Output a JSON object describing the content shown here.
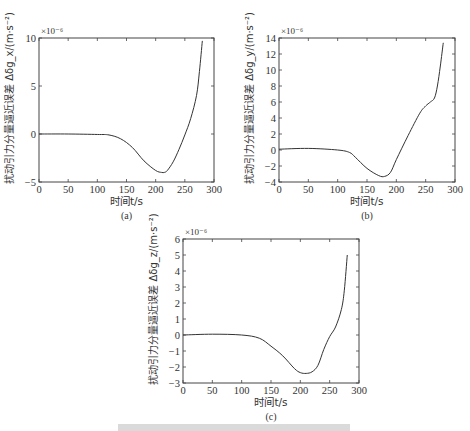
{
  "figure": {
    "caption_partial": "图 ... 摄动引力分量逼近误差 (caption cut off at bottom)"
  },
  "chart_data": [
    {
      "id": "a",
      "type": "line",
      "panel_label": "(a)",
      "xlabel": "时间t/s",
      "ylabel": "扰动引力分量逼近误差 Δδg_x/(m·s⁻²)",
      "y_multiplier": "×10⁻⁶",
      "xlim": [
        0,
        300
      ],
      "ylim": [
        -5,
        10
      ],
      "xticks": [
        0,
        50,
        100,
        150,
        200,
        250,
        300
      ],
      "yticks": [
        -5,
        0,
        5,
        10
      ],
      "grid": false,
      "x": [
        0,
        50,
        100,
        120,
        140,
        160,
        180,
        200,
        210,
        215,
        220,
        230,
        240,
        250,
        260,
        270,
        275,
        280
      ],
      "y": [
        0,
        0,
        -0.05,
        -0.1,
        -0.5,
        -1.4,
        -2.8,
        -3.8,
        -4.0,
        -4.0,
        -3.8,
        -2.9,
        -1.6,
        -0.1,
        1.6,
        4.0,
        6.5,
        9.7
      ]
    },
    {
      "id": "b",
      "type": "line",
      "panel_label": "(b)",
      "xlabel": "时间t/s",
      "ylabel": "扰动引力分量逼近误差 Δδg_y/(m·s⁻²)",
      "y_multiplier": "×10⁻⁶",
      "xlim": [
        0,
        300
      ],
      "ylim": [
        -4,
        14
      ],
      "xticks": [
        0,
        50,
        100,
        150,
        200,
        250,
        300
      ],
      "yticks": [
        -4,
        -2,
        0,
        2,
        4,
        6,
        8,
        10,
        12,
        14
      ],
      "grid": false,
      "x": [
        0,
        50,
        100,
        120,
        130,
        150,
        170,
        180,
        190,
        200,
        220,
        240,
        250,
        258,
        265,
        270,
        275,
        280
      ],
      "y": [
        0.1,
        0.2,
        0.0,
        -0.3,
        -0.9,
        -2.3,
        -3.2,
        -3.3,
        -2.8,
        -1.2,
        1.8,
        4.6,
        5.5,
        6.0,
        6.5,
        8.0,
        10.5,
        13.4
      ]
    },
    {
      "id": "c",
      "type": "line",
      "panel_label": "(c)",
      "xlabel": "时间t/s",
      "ylabel": "扰动引力分量逼近误差 Δδg_z/(m·s⁻²)",
      "y_multiplier": "×10⁻⁶",
      "xlim": [
        0,
        300
      ],
      "ylim": [
        -3,
        6
      ],
      "xticks": [
        0,
        50,
        100,
        150,
        200,
        250,
        300
      ],
      "yticks": [
        -3,
        -2,
        -1,
        0,
        1,
        2,
        3,
        4,
        5,
        6
      ],
      "grid": false,
      "x": [
        0,
        50,
        100,
        130,
        150,
        170,
        190,
        200,
        210,
        220,
        230,
        240,
        250,
        260,
        270,
        275,
        280
      ],
      "y": [
        0,
        0.05,
        0.0,
        -0.2,
        -0.7,
        -1.3,
        -2.1,
        -2.35,
        -2.4,
        -2.3,
        -1.9,
        -0.9,
        -0.1,
        0.5,
        1.6,
        2.8,
        5.0
      ]
    }
  ]
}
